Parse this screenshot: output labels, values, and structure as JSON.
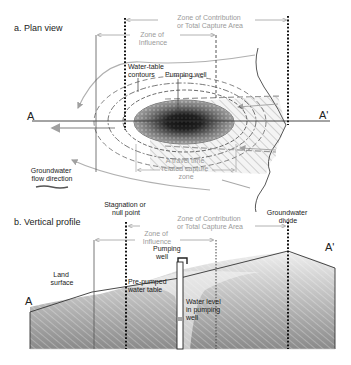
{
  "plan_view": {
    "title": "a. Plan view",
    "zone_contribution": [
      "Zone of Contribution",
      "or Total Capture Area"
    ],
    "zone_influence": [
      "Zone of",
      "Influence"
    ],
    "water_table_contours": [
      "Water-table",
      "contours"
    ],
    "pumping_well": "Pumping well",
    "section_start": "A",
    "section_end": "A'",
    "travel_time_zone": [
      "A travel time",
      "related capture",
      "zone"
    ],
    "flow_direction": [
      "Groundwater",
      "flow direction"
    ]
  },
  "vertical_profile": {
    "title": "b. Vertical profile",
    "stagnation_point": [
      "Stagnation or",
      "null point"
    ],
    "zone_contribution": [
      "Zone of Contribution",
      "or Total Capture Area"
    ],
    "zone_influence": [
      "Zone of",
      "Influence"
    ],
    "groundwater_divide": [
      "Groundwater",
      "divide"
    ],
    "pumping_well": [
      "Pumping",
      "well"
    ],
    "land_surface": [
      "Land",
      "surface"
    ],
    "prepumped_water_table": [
      "Pre-pumped",
      "water table"
    ],
    "water_level_in_well": [
      "Water level",
      "in pumping",
      "well"
    ],
    "section_start": "A",
    "section_end": "A'"
  },
  "colors": {
    "line_dark": "#333333",
    "line_grey": "#a0a0a0",
    "text_grey": "#9a9a9a",
    "hatch_grey": "#d8d8d8"
  }
}
